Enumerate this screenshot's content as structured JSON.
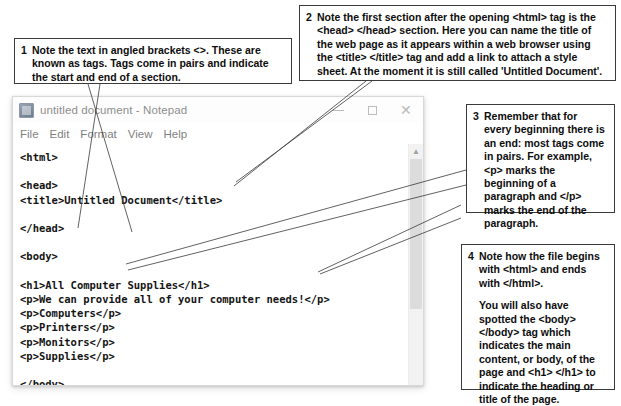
{
  "window": {
    "title": "untitled document - Notepad",
    "icon": "notepad-icon",
    "menu": [
      "File",
      "Edit",
      "Format",
      "View",
      "Help"
    ],
    "controls": {
      "minimize": "minimize-button",
      "maximize": "maximize-button",
      "close": "close-button"
    },
    "code": "<html>\n\n<head>\n<title>Untitled Document</title>\n\n</head>\n\n<body>\n\n<h1>All Computer Supplies</h1>\n<p>We can provide all of your computer needs!</p>\n<p>Computers</p>\n<p>Printers</p>\n<p>Monitors</p>\n<p>Supplies</p>\n\n</body>\n</html>"
  },
  "callouts": [
    {
      "number": "1",
      "text": "Note the text in angled brackets <>. These are known as tags. Tags come in pairs and indicate the start and end of a section."
    },
    {
      "number": "2",
      "text": "Note the first section after the opening <html> tag is the <head> </head> section. Here you can name the title of the web page as it appears within a web browser using the <title> </title> tag and add a link to attach a style sheet. At the moment it is still called 'Untitled Document'."
    },
    {
      "number": "3",
      "text": "Remember that for every beginning there is an end: most tags come in pairs. For example, <p> marks the beginning of a paragraph and </p> marks the end of the paragraph."
    },
    {
      "number": "4",
      "paragraph_1": "Note how the file begins with <html> and ends with </html>.",
      "paragraph_2": "You will also have spotted the <body> </body> tag which indicates the main content, or body, of the page and <h1> </h1> to indicate the heading or title of the page."
    }
  ],
  "colors": {
    "box_border": "#3a3a3a",
    "window_chrome": "#fdfdfd",
    "title_text": "#8e8e8e",
    "code_text": "#141414",
    "scrollbar_track": "#f2f2f2",
    "scrollbar_thumb": "#dcdcdc"
  }
}
